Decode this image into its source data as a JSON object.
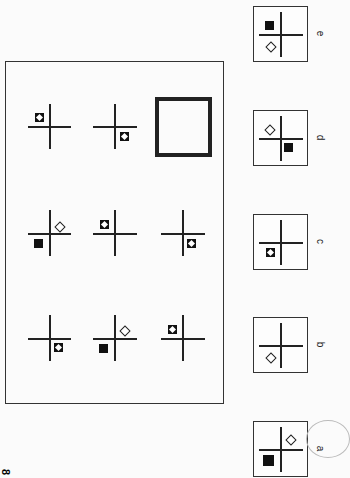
{
  "problem_number": "8",
  "matrix": {
    "rows": [
      [
        {
          "filled_frame": "top-left",
          "diamond": null,
          "solid": null
        },
        {
          "filled_frame": "bottom-right",
          "diamond": null,
          "solid": null
        },
        {
          "empty_answer_slot": true
        }
      ],
      [
        {
          "diamond": "top-right",
          "solid": "bottom-left"
        },
        {
          "filled_frame": "top-left"
        },
        {
          "filled_frame": "bottom-right"
        }
      ],
      [
        {
          "filled_frame": "bottom-right"
        },
        {
          "diamond": "top-right",
          "solid": "bottom-left"
        },
        {
          "filled_frame": "top-left"
        }
      ]
    ]
  },
  "options": [
    {
      "label": "e",
      "solid": "top-left",
      "diamond": "bottom-left"
    },
    {
      "label": "d",
      "diamond": "top-left",
      "solid": "bottom-right"
    },
    {
      "label": "c",
      "filled_frame": "bottom-left"
    },
    {
      "label": "b",
      "diamond": "bottom-left"
    },
    {
      "label": "a",
      "diamond": "top-right",
      "solid": "bottom-left",
      "circled": true
    }
  ]
}
